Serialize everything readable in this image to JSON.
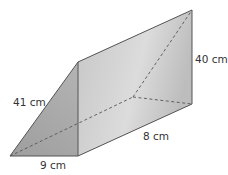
{
  "diagram": {
    "type": "triangular-prism",
    "labels": {
      "hypotenuse": "41 cm",
      "base": "9 cm",
      "length": "8 cm",
      "height": "40 cm"
    },
    "colors": {
      "face_light": "#d8d8d8",
      "face_dark": "#a9a9a9",
      "edge": "#555555"
    }
  }
}
